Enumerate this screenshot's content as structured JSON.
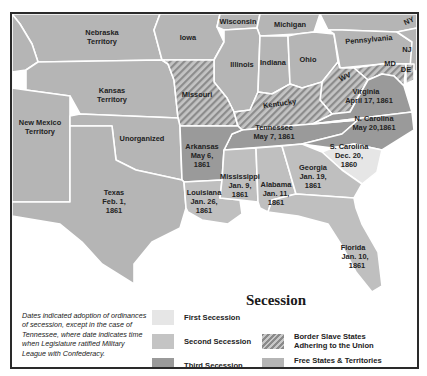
{
  "map": {
    "colors": {
      "first_secession": "#e6e6e6",
      "second_secession": "#bfbfbf",
      "third_secession": "#9a9a9a",
      "border_slave_hatch_bg": "#c2c2c2",
      "border_slave_hatch_line": "#8a8a8a",
      "free_states": "#b5b5b5",
      "boundary": "#ffffff",
      "frame": "#2a2a2a"
    },
    "regions": {
      "nebraska": {
        "name": "Nebraska",
        "sub": "Territory"
      },
      "iowa": {
        "name": "Iowa"
      },
      "wisconsin": {
        "name": "Wisconsin"
      },
      "michigan": {
        "name": "Michigan"
      },
      "ny": {
        "name": "NY"
      },
      "pennsylvania": {
        "name": "Pennsylvania"
      },
      "nj": {
        "name": "NJ"
      },
      "md": {
        "name": "MD"
      },
      "de": {
        "name": "DE"
      },
      "illinois": {
        "name": "Illinois"
      },
      "indiana": {
        "name": "Indiana"
      },
      "ohio": {
        "name": "Ohio"
      },
      "wv": {
        "name": "WV"
      },
      "kansas": {
        "name": "Kansas",
        "sub": "Territory"
      },
      "missouri": {
        "name": "Missouri"
      },
      "kentucky": {
        "name": "Kentucky"
      },
      "virginia": {
        "name": "Virginia",
        "date": "April 17, 1861"
      },
      "new_mexico": {
        "name": "New Mexico",
        "sub": "Territory"
      },
      "unorganized": {
        "name": "Unorganized"
      },
      "tennessee": {
        "name": "Tennessee",
        "date": "May 7, 1861"
      },
      "n_carolina": {
        "name": "N. Carolina",
        "date": "May 20,1861"
      },
      "arkansas": {
        "name": "Arkansas",
        "date1": "May 6,",
        "date2": "1861"
      },
      "s_carolina": {
        "name": "S. Carolina",
        "date1": "Dec. 20,",
        "date2": "1860"
      },
      "texas": {
        "name": "Texas",
        "date1": "Feb. 1,",
        "date2": "1861"
      },
      "louisiana": {
        "name": "Louisiana",
        "date1": "Jan. 26,",
        "date2": "1861"
      },
      "mississippi": {
        "name": "Mississippi",
        "date1": "Jan. 9,",
        "date2": "1861"
      },
      "alabama": {
        "name": "Alabama",
        "date1": "Jan. 11,",
        "date2": "1861"
      },
      "georgia": {
        "name": "Georgia",
        "date1": "Jan. 19,",
        "date2": "1861"
      },
      "florida": {
        "name": "Florida",
        "date1": "Jan. 10,",
        "date2": "1861"
      }
    }
  },
  "legend": {
    "title": "Secession",
    "items": [
      {
        "label": "First Secession"
      },
      {
        "label": "Second Secession"
      },
      {
        "label": "Third Secession"
      },
      {
        "label1": "Border Slave States",
        "label2": "Adhering to the Union"
      },
      {
        "label1": "Free States & Territories",
        "label2": "Adhering to the Union"
      }
    ]
  },
  "note": "Dates indicated adoption of ordinances of secession, except in the case of Tennessee, where date indicates time when Legislature ratified Military League with Confederacy."
}
